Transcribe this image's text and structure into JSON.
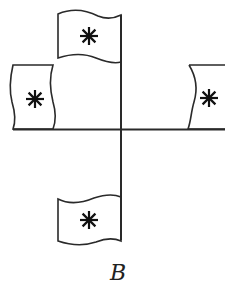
{
  "diagram": {
    "label": "B",
    "colors": {
      "stroke": "#2a2a2a",
      "background": "#ffffff"
    },
    "axes": {
      "horizontal": {
        "y": 129,
        "x1": 13,
        "x2": 225
      },
      "vertical": {
        "x": 121,
        "y1": 15,
        "y2": 240
      }
    },
    "flags": [
      {
        "id": "top",
        "orientation": "flying left from vertical pole",
        "symbol": "asterisk"
      },
      {
        "id": "left",
        "orientation": "standing on horizontal line",
        "symbol": "asterisk"
      },
      {
        "id": "right",
        "orientation": "standing on horizontal line (partially cropped)",
        "symbol": "asterisk"
      },
      {
        "id": "bottom",
        "orientation": "flying left from vertical pole",
        "symbol": "asterisk"
      }
    ]
  }
}
